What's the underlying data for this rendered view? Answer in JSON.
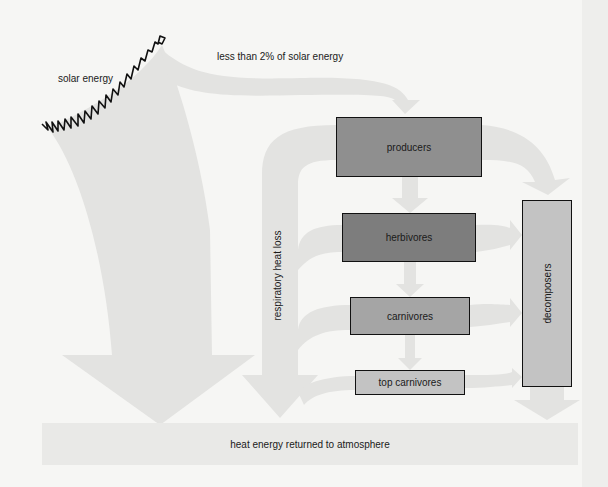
{
  "labels": {
    "solar_energy": "solar energy",
    "less_than_2pct": "less than 2% of solar energy",
    "respiratory_heat_loss": "respiratory heat loss",
    "heat_returned": "heat energy returned to atmosphere"
  },
  "nodes": {
    "producers": "producers",
    "herbivores": "herbivores",
    "carnivores": "carnivores",
    "top_carnivores": "top carnivores",
    "decomposers": "decomposers"
  },
  "colors": {
    "background": "#f6f6f4",
    "flow_arrow": "#e3e3e1",
    "heat_bar": "#e9e9e7",
    "producers": "#8f8f8f",
    "herbivores": "#7d7d7d",
    "carnivores": "#a5a5a5",
    "top_carnivores": "#c3c3c3",
    "decomposers": "#c3c3c3",
    "sun_outline": "#111111"
  }
}
